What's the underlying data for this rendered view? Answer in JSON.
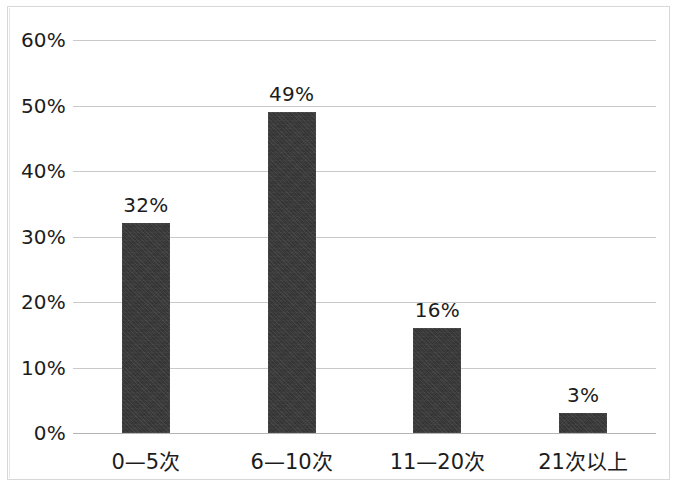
{
  "chart_data": {
    "type": "bar",
    "title": "",
    "subtitle": "",
    "xlabel": "",
    "ylabel": "",
    "categories": [
      "0—5次",
      "6—10次",
      "11—20次",
      "21次以上"
    ],
    "values": [
      32,
      49,
      16,
      3
    ],
    "value_labels": [
      "32%",
      "49%",
      "16%",
      "3%"
    ],
    "ylim": [
      0,
      60
    ],
    "ytick_values": [
      0,
      10,
      20,
      30,
      40,
      50,
      60
    ],
    "ytick_labels": [
      "0%",
      "10%",
      "20%",
      "30%",
      "40%",
      "50%",
      "60%"
    ],
    "grid": true,
    "grid_axis": "y",
    "legend": false,
    "legend_position": "none",
    "series": [
      {
        "name": "",
        "values": [
          32,
          49,
          16,
          3
        ],
        "color": "#333333"
      }
    ],
    "annotations": []
  },
  "style": {
    "bar_color": "#333333",
    "grid_color": "#c9c9c9",
    "axis_color": "#b4b4b4",
    "text_color": "#1c1c1c",
    "background": "#ffffff",
    "frame_color": "#d8d8d8"
  }
}
